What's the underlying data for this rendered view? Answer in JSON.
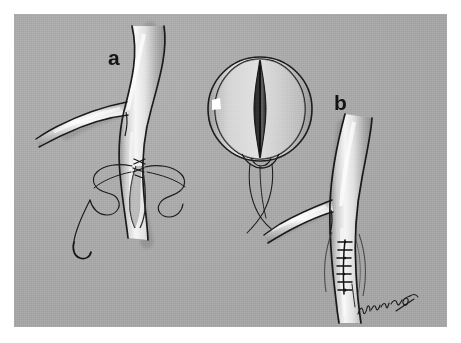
{
  "figure": {
    "kind": "medical-illustration",
    "background_color": "#a9a9a9",
    "page_color": "#ffffff",
    "ink_color": "#1a1a1a",
    "vessel_highlight_color": "#f2f2f2",
    "vessel_shadow_color": "#8a8a8a",
    "lumen_color": "#2b2b2b",
    "highlight_marker_color": "#ffffff"
  },
  "panels": [
    {
      "id": "a",
      "label": "a",
      "caption_text": "a",
      "description": "Branching artery with open longitudinal arteriotomy; first sutures placed at the apex with long suture tails and a curved needle."
    },
    {
      "id": "b",
      "label": "b",
      "caption_text": "b",
      "description": "Same branching artery after completed closure with a row of interrupted sutures along the arteriotomy."
    }
  ],
  "inset": {
    "id": "cross-section",
    "description": "Circular cross-sectional view of the vessel showing the slit-like lumen, with suture threads descending below.",
    "highlight_marker": "white-marker"
  },
  "annotations": {
    "signature": "Wm Barth",
    "suture_count_panel_a": 3,
    "suture_count_panel_b": 7
  }
}
